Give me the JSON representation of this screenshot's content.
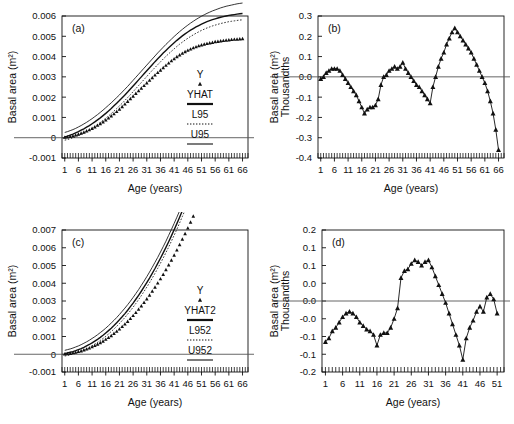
{
  "figure": {
    "background": "#ffffff",
    "ink": "#111111",
    "panels": [
      "a",
      "b",
      "c",
      "d"
    ]
  },
  "chart_data": [
    {
      "id": "a",
      "type": "scatter",
      "panel_label": "(a)",
      "title": "",
      "xlabel": "Age (years)",
      "ylabel": "Basal area (m²)",
      "xlim": [
        0,
        68
      ],
      "ylim": [
        -0.001,
        0.006
      ],
      "xticks": [
        1,
        6,
        11,
        16,
        21,
        26,
        31,
        36,
        41,
        46,
        51,
        56,
        61,
        66
      ],
      "yticks": [
        -0.001,
        0,
        0.001,
        0.002,
        0.003,
        0.004,
        0.005,
        0.006
      ],
      "ytick_labels": [
        "-0.001",
        "0",
        "0.001",
        "0.002",
        "0.003",
        "0.004",
        "0.005",
        "0.006"
      ],
      "grid": false,
      "zero_line": 0,
      "legend_position": "inside-right",
      "legend": [
        {
          "name": "Y",
          "style": "marker",
          "marker": "triangle"
        },
        {
          "name": "YHAT",
          "style": "solid-thick"
        },
        {
          "name": "L95",
          "style": "dotted"
        },
        {
          "name": "U95",
          "style": "solid-thin"
        }
      ],
      "x": [
        1,
        2,
        3,
        4,
        5,
        6,
        7,
        8,
        9,
        10,
        11,
        12,
        13,
        14,
        15,
        16,
        17,
        18,
        19,
        20,
        21,
        22,
        23,
        24,
        25,
        26,
        27,
        28,
        29,
        30,
        31,
        32,
        33,
        34,
        35,
        36,
        37,
        38,
        39,
        40,
        41,
        42,
        43,
        44,
        45,
        46,
        47,
        48,
        49,
        50,
        51,
        52,
        53,
        54,
        55,
        56,
        57,
        58,
        59,
        60,
        61,
        62,
        63,
        64,
        65,
        66
      ],
      "series": [
        {
          "name": "Y",
          "style": "marker",
          "values": [
            2e-05,
            4e-05,
            6e-05,
            9e-05,
            0.00013,
            0.00017,
            0.00022,
            0.00027,
            0.00033,
            0.00039,
            0.00046,
            0.00053,
            0.00061,
            0.00069,
            0.00078,
            0.00087,
            0.00097,
            0.00107,
            0.00118,
            0.00129,
            0.00141,
            0.00153,
            0.00166,
            0.00179,
            0.00192,
            0.00205,
            0.00218,
            0.00231,
            0.00244,
            0.00257,
            0.0027,
            0.00283,
            0.00296,
            0.00309,
            0.00321,
            0.00333,
            0.00345,
            0.00357,
            0.00368,
            0.00379,
            0.00389,
            0.00399,
            0.00408,
            0.00416,
            0.00424,
            0.00431,
            0.00437,
            0.00443,
            0.00448,
            0.00453,
            0.00457,
            0.00461,
            0.00464,
            0.00467,
            0.0047,
            0.00473,
            0.00475,
            0.00477,
            0.00479,
            0.00481,
            0.00482,
            0.00484,
            0.00485,
            0.00486,
            0.00487,
            0.00488
          ]
        },
        {
          "name": "YHAT",
          "style": "solid-thick",
          "values": [
            4e-05,
            8e-05,
            0.00013,
            0.00018,
            0.00024,
            0.0003,
            0.00037,
            0.00044,
            0.00052,
            0.0006,
            0.00069,
            0.00078,
            0.00088,
            0.00098,
            0.00109,
            0.0012,
            0.00132,
            0.00144,
            0.00157,
            0.0017,
            0.00183,
            0.00197,
            0.00211,
            0.00225,
            0.0024,
            0.00255,
            0.0027,
            0.00285,
            0.003,
            0.00315,
            0.0033,
            0.00345,
            0.0036,
            0.00375,
            0.00389,
            0.00403,
            0.00417,
            0.0043,
            0.00443,
            0.00456,
            0.00468,
            0.0048,
            0.00491,
            0.00502,
            0.00512,
            0.00521,
            0.0053,
            0.00538,
            0.00546,
            0.00553,
            0.0056,
            0.00566,
            0.00572,
            0.00577,
            0.00582,
            0.00586,
            0.0059,
            0.00594,
            0.00597,
            0.006,
            0.00603,
            0.00605,
            0.00607,
            0.00609,
            0.00611,
            0.00612
          ]
        },
        {
          "name": "L95",
          "style": "dotted",
          "values": [
            -0.00012,
            -9e-05,
            -5e-05,
            0.0,
            5e-05,
            0.00011,
            0.00017,
            0.00024,
            0.00031,
            0.00039,
            0.00047,
            0.00056,
            0.00065,
            0.00075,
            0.00085,
            0.00096,
            0.00107,
            0.00119,
            0.00131,
            0.00144,
            0.00157,
            0.0017,
            0.00184,
            0.00198,
            0.00212,
            0.00227,
            0.00242,
            0.00257,
            0.00272,
            0.00287,
            0.00302,
            0.00317,
            0.00332,
            0.00346,
            0.0036,
            0.00374,
            0.00388,
            0.00401,
            0.00414,
            0.00426,
            0.00438,
            0.0045,
            0.00461,
            0.00471,
            0.00481,
            0.0049,
            0.00499,
            0.00507,
            0.00515,
            0.00522,
            0.00529,
            0.00535,
            0.00541,
            0.00546,
            0.00551,
            0.00555,
            0.00559,
            0.00563,
            0.00566,
            0.00569,
            0.00572,
            0.00574,
            0.00576,
            0.00578,
            0.0058,
            0.00581
          ]
        },
        {
          "name": "U95",
          "style": "solid-thin",
          "values": [
            0.00026,
            0.0003,
            0.00035,
            0.0004,
            0.00046,
            0.00053,
            0.0006,
            0.00068,
            0.00076,
            0.00085,
            0.00094,
            0.00104,
            0.00114,
            0.00125,
            0.00136,
            0.00148,
            0.0016,
            0.00172,
            0.00185,
            0.00198,
            0.00211,
            0.00225,
            0.00239,
            0.00253,
            0.00268,
            0.00283,
            0.00298,
            0.00313,
            0.00328,
            0.00343,
            0.00358,
            0.00373,
            0.00388,
            0.00403,
            0.00418,
            0.00432,
            0.00446,
            0.0046,
            0.00473,
            0.00486,
            0.00499,
            0.00511,
            0.00523,
            0.00534,
            0.00545,
            0.00555,
            0.00565,
            0.00574,
            0.00583,
            0.00591,
            0.00599,
            0.00606,
            0.00613,
            0.00619,
            0.00625,
            0.0063,
            0.00635,
            0.0064,
            0.00644,
            0.00648,
            0.00651,
            0.00654,
            0.00657,
            0.0066,
            0.00662,
            0.00664
          ]
        }
      ]
    },
    {
      "id": "b",
      "type": "line",
      "panel_label": "(b)",
      "title": "",
      "xlabel": "Age (years)",
      "ylabel": "Basal area (m²) Thousandths",
      "ylabel_lines": [
        "Basal area (m²)",
        "Thousandths"
      ],
      "xlim": [
        0,
        68
      ],
      "ylim": [
        -0.4,
        0.3
      ],
      "xticks": [
        1,
        6,
        11,
        16,
        21,
        26,
        31,
        36,
        41,
        46,
        51,
        56,
        61,
        66
      ],
      "yticks": [
        -0.4,
        -0.3,
        -0.2,
        -0.1,
        0.0,
        0.1,
        0.2,
        0.3
      ],
      "ytick_labels": [
        "-0.4",
        "-0.3",
        "-0.2",
        "-0.1",
        "0.0",
        "0.1",
        "0.2",
        "0.3"
      ],
      "grid": false,
      "zero_line": 0,
      "marker": "triangle",
      "x": [
        1,
        2,
        3,
        4,
        5,
        6,
        7,
        8,
        9,
        10,
        11,
        12,
        13,
        14,
        15,
        16,
        17,
        18,
        19,
        20,
        21,
        22,
        23,
        24,
        25,
        26,
        27,
        28,
        29,
        30,
        31,
        32,
        33,
        34,
        35,
        36,
        37,
        38,
        39,
        40,
        41,
        42,
        43,
        44,
        45,
        46,
        47,
        48,
        49,
        50,
        51,
        52,
        53,
        54,
        55,
        56,
        57,
        58,
        59,
        60,
        61,
        62,
        63,
        64,
        65,
        66
      ],
      "values": [
        -0.01,
        0.0,
        0.02,
        0.03,
        0.04,
        0.04,
        0.04,
        0.03,
        0.01,
        -0.01,
        -0.03,
        -0.05,
        -0.07,
        -0.09,
        -0.12,
        -0.15,
        -0.18,
        -0.16,
        -0.15,
        -0.15,
        -0.14,
        -0.11,
        -0.04,
        0.0,
        0.01,
        0.03,
        0.04,
        0.05,
        0.04,
        0.05,
        0.07,
        0.04,
        0.02,
        0.0,
        -0.02,
        -0.04,
        -0.05,
        -0.07,
        -0.09,
        -0.11,
        -0.13,
        -0.05,
        0.0,
        0.05,
        0.09,
        0.12,
        0.16,
        0.19,
        0.22,
        0.24,
        0.22,
        0.2,
        0.18,
        0.16,
        0.14,
        0.12,
        0.09,
        0.06,
        0.03,
        0.0,
        -0.03,
        -0.07,
        -0.12,
        -0.18,
        -0.26,
        -0.36
      ]
    },
    {
      "id": "c",
      "type": "scatter",
      "panel_label": "(c)",
      "title": "",
      "xlabel": "Age (years)",
      "ylabel": "Basal area (m²)",
      "xlim": [
        0,
        68
      ],
      "ylim": [
        -0.001,
        0.007
      ],
      "xticks": [
        1,
        6,
        11,
        16,
        21,
        26,
        31,
        36,
        41,
        46,
        51,
        56,
        61,
        66
      ],
      "yticks": [
        -0.001,
        0,
        0.001,
        0.002,
        0.003,
        0.004,
        0.005,
        0.006,
        0.007
      ],
      "ytick_labels": [
        "-0.001",
        "0",
        "0.001",
        "0.002",
        "0.003",
        "0.004",
        "0.005",
        "0.006",
        "0.007"
      ],
      "grid": false,
      "zero_line": 0,
      "legend_position": "inside-right",
      "legend": [
        {
          "name": "Y",
          "style": "marker",
          "marker": "triangle"
        },
        {
          "name": "YHAT2",
          "style": "solid-thick"
        },
        {
          "name": "L952",
          "style": "dotted"
        },
        {
          "name": "U952",
          "style": "solid-thin"
        }
      ],
      "x": [
        1,
        2,
        3,
        4,
        5,
        6,
        7,
        8,
        9,
        10,
        11,
        12,
        13,
        14,
        15,
        16,
        17,
        18,
        19,
        20,
        21,
        22,
        23,
        24,
        25,
        26,
        27,
        28,
        29,
        30,
        31,
        32,
        33,
        34,
        35,
        36,
        37,
        38,
        39,
        40,
        41,
        42,
        43,
        44,
        45,
        46,
        47,
        48,
        49,
        50,
        51
      ],
      "series": [
        {
          "name": "Y",
          "style": "marker",
          "values": [
            1e-05,
            3e-05,
            5e-05,
            8e-05,
            0.00011,
            0.00015,
            0.00019,
            0.00024,
            0.00029,
            0.00035,
            0.00042,
            0.00049,
            0.00057,
            0.00065,
            0.00074,
            0.00084,
            0.00094,
            0.00105,
            0.00117,
            0.00129,
            0.00142,
            0.00156,
            0.0017,
            0.00185,
            0.00201,
            0.00218,
            0.00235,
            0.00253,
            0.00272,
            0.00292,
            0.00312,
            0.00333,
            0.00355,
            0.00378,
            0.00401,
            0.00425,
            0.0045,
            0.00476,
            0.00503,
            0.0053,
            0.00558,
            0.00587,
            0.00617,
            0.00648,
            0.00679,
            0.00711,
            0.00744,
            0.00778,
            0.00813,
            0.00849,
            0.00885
          ]
        },
        {
          "name": "YHAT2",
          "style": "solid-thick",
          "values": [
            4e-05,
            7e-05,
            0.00011,
            0.00015,
            0.0002,
            0.00026,
            0.00032,
            0.00039,
            0.00047,
            0.00055,
            0.00064,
            0.00074,
            0.00084,
            0.00095,
            0.00107,
            0.0012,
            0.00133,
            0.00147,
            0.00162,
            0.00178,
            0.00194,
            0.00211,
            0.00229,
            0.00248,
            0.00268,
            0.00288,
            0.0031,
            0.00332,
            0.00355,
            0.00379,
            0.00404,
            0.00429,
            0.00456,
            0.00483,
            0.00512,
            0.00541,
            0.00571,
            0.00602,
            0.00634,
            0.00667,
            0.00701,
            0.00736,
            0.00772,
            0.00809,
            0.00846,
            0.00885,
            0.00925,
            0.00965,
            0.01007,
            0.01049,
            0.01093
          ]
        },
        {
          "name": "L952",
          "style": "dotted",
          "values": [
            -0.0001,
            -7e-05,
            -3e-05,
            1e-05,
            6e-05,
            0.00011,
            0.00017,
            0.00024,
            0.00031,
            0.00039,
            0.00048,
            0.00057,
            0.00067,
            0.00078,
            0.00089,
            0.00101,
            0.00114,
            0.00128,
            0.00142,
            0.00157,
            0.00173,
            0.0019,
            0.00207,
            0.00226,
            0.00245,
            0.00265,
            0.00286,
            0.00308,
            0.0033,
            0.00354,
            0.00378,
            0.00403,
            0.00429,
            0.00456,
            0.00484,
            0.00513,
            0.00542,
            0.00573,
            0.00604,
            0.00637,
            0.0067,
            0.00704,
            0.0074,
            0.00776,
            0.00813,
            0.00851,
            0.0089,
            0.0093,
            0.00971,
            0.01013,
            0.01056
          ]
        },
        {
          "name": "U952",
          "style": "solid-thin",
          "values": [
            0.00022,
            0.00026,
            0.0003,
            0.00035,
            0.00041,
            0.00047,
            0.00054,
            0.00062,
            0.0007,
            0.00079,
            0.00089,
            0.00099,
            0.0011,
            0.00122,
            0.00134,
            0.00147,
            0.00161,
            0.00176,
            0.00191,
            0.00207,
            0.00224,
            0.00242,
            0.0026,
            0.00279,
            0.00299,
            0.0032,
            0.00342,
            0.00364,
            0.00388,
            0.00412,
            0.00437,
            0.00463,
            0.0049,
            0.00518,
            0.00546,
            0.00576,
            0.00606,
            0.00637,
            0.0067,
            0.00703,
            0.00737,
            0.00772,
            0.00808,
            0.00845,
            0.00883,
            0.00922,
            0.00962,
            0.01003,
            0.01045,
            0.01088,
            0.01132
          ]
        }
      ]
    },
    {
      "id": "d",
      "type": "line",
      "panel_label": "(d)",
      "title": "",
      "xlabel": "Age (years)",
      "ylabel": "Basal area (m²) Thousandths",
      "ylabel_lines": [
        "Basal area (m²)",
        "Thousandths"
      ],
      "xlim": [
        0,
        53
      ],
      "ylim": [
        -0.2,
        0.2
      ],
      "xticks": [
        1,
        6,
        11,
        16,
        21,
        26,
        31,
        36,
        41,
        46,
        51
      ],
      "yticks": [
        -0.2,
        -0.15,
        -0.1,
        -0.05,
        0.0,
        0.05,
        0.1,
        0.15,
        0.2
      ],
      "ytick_labels": [
        "-0.2",
        "-0.1",
        "-0.1",
        "-0.0",
        "0.0",
        "0.0",
        "0.1",
        "0.1",
        "0.2"
      ],
      "grid": false,
      "zero_line": 0,
      "marker": "triangle",
      "x": [
        1,
        2,
        3,
        4,
        5,
        6,
        7,
        8,
        9,
        10,
        11,
        12,
        13,
        14,
        15,
        16,
        17,
        18,
        19,
        20,
        21,
        22,
        23,
        24,
        25,
        26,
        27,
        28,
        29,
        30,
        31,
        32,
        33,
        34,
        35,
        36,
        37,
        38,
        39,
        40,
        41,
        42,
        43,
        44,
        45,
        46,
        47,
        48,
        49,
        50,
        51
      ],
      "values": [
        -0.115,
        -0.105,
        -0.085,
        -0.075,
        -0.06,
        -0.045,
        -0.035,
        -0.03,
        -0.035,
        -0.045,
        -0.06,
        -0.07,
        -0.08,
        -0.085,
        -0.095,
        -0.125,
        -0.095,
        -0.09,
        -0.09,
        -0.075,
        -0.05,
        -0.02,
        0.065,
        0.085,
        0.09,
        0.105,
        0.115,
        0.11,
        0.1,
        0.11,
        0.115,
        0.095,
        0.07,
        0.045,
        0.02,
        -0.005,
        -0.035,
        -0.065,
        -0.095,
        -0.125,
        -0.165,
        -0.105,
        -0.075,
        -0.055,
        -0.03,
        -0.015,
        -0.03,
        0.01,
        0.02,
        0.005,
        -0.035
      ]
    }
  ]
}
